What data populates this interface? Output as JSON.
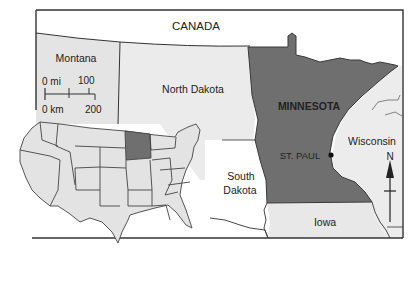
{
  "map": {
    "title": "MINNESOTA",
    "capital": "ST. PAUL",
    "labels": {
      "canada": "CANADA",
      "montana": "Montana",
      "north_dakota": "North Dakota",
      "minnesota": "MINNESOTA",
      "wisconsin": "Wisconsin",
      "south_dakota_line1": "South",
      "south_dakota_line2": "Dakota",
      "iowa": "Iowa",
      "st_paul": "ST. PAUL"
    },
    "scale_bar": {
      "mi_zero": "0 mi",
      "mi_max": "100",
      "km_zero": "0 km",
      "km_max": "200"
    },
    "compass": {
      "north_label": "N"
    },
    "inset": {
      "description": "Outline map of the contiguous United States with Minnesota highlighted"
    },
    "colors": {
      "highlight": "#6f6f6f",
      "land": "#e6e6e6",
      "water_or_outside": "#ffffff",
      "border": "#333333"
    }
  }
}
